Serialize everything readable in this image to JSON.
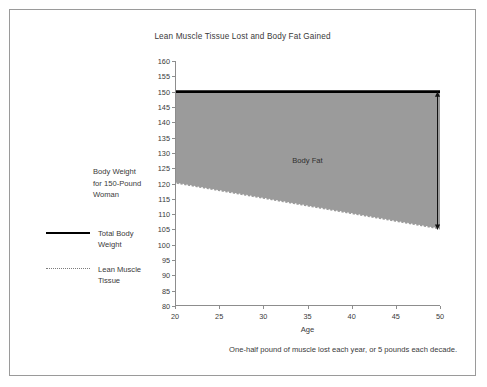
{
  "chart_data": {
    "type": "area",
    "title": "Lean Muscle Tissue Lost and Body Fat Gained",
    "xlabel": "Age",
    "ylabel": "Body Weight for 150-Pound Woman",
    "xlim": [
      20,
      50
    ],
    "ylim": [
      80,
      160
    ],
    "xticks": [
      20,
      25,
      30,
      35,
      40,
      45,
      50
    ],
    "yticks": [
      80,
      85,
      90,
      95,
      100,
      105,
      110,
      115,
      120,
      125,
      130,
      135,
      140,
      145,
      150,
      155,
      160
    ],
    "grid": false,
    "legend_position": "left",
    "x": [
      20,
      50
    ],
    "series": [
      {
        "name": "Total Body Weight",
        "style": "solid",
        "color": "#000000",
        "values": [
          150,
          150
        ]
      },
      {
        "name": "Lean Muscle Tissue",
        "style": "dotted",
        "color": "#7c7c7c",
        "values": [
          120,
          105
        ]
      }
    ],
    "filled_region": {
      "label": "Body Fat",
      "between": [
        "Total Body Weight",
        "Lean Muscle Tissue"
      ],
      "color": "#9b9b9b"
    },
    "annotations": [
      {
        "name": "body-fat-gap-arrow",
        "type": "double-arrow",
        "x": 50,
        "y_from": 105,
        "y_to": 150
      }
    ],
    "caption": "One-half pound of muscle lost each year, or 5 pounds each decade."
  },
  "legend": {
    "items": [
      {
        "label_line1": "Total Body",
        "label_line2": "Weight"
      },
      {
        "label_line1": "Lean Muscle",
        "label_line2": "Tissue"
      }
    ]
  },
  "ylabel_lines": {
    "line1": "Body Weight",
    "line2": "for 150-Pound",
    "line3": "Woman"
  }
}
